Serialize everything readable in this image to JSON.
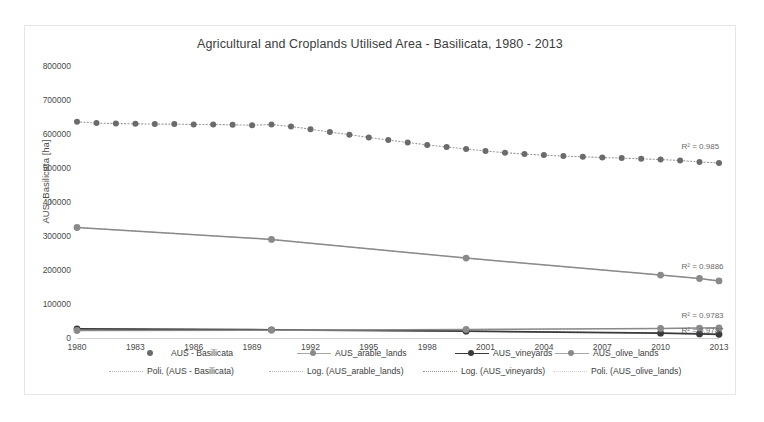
{
  "chart_data": {
    "type": "scatter",
    "title": "Agricultural and Croplands Utilised Area - Basilicata, 1980 - 2013",
    "xlabel": "",
    "ylabel": "AUS_Basilicata [ha]",
    "xlim": [
      1980,
      2013
    ],
    "ylim": [
      0,
      800000
    ],
    "grid": false,
    "legend_position": "bottom",
    "y_ticks": [
      "800000",
      "700000",
      "600000",
      "500000",
      "400000",
      "300000",
      "200000",
      "100000",
      "0"
    ],
    "y_tick_values": [
      800000,
      700000,
      600000,
      500000,
      400000,
      300000,
      200000,
      100000,
      0
    ],
    "x_ticks": [
      "1980",
      "1983",
      "1986",
      "1989",
      "1992",
      "1995",
      "1998",
      "2001",
      "2004",
      "2007",
      "2010",
      "2013"
    ],
    "x_tick_values": [
      1980,
      1983,
      1986,
      1989,
      1992,
      1995,
      1998,
      2001,
      2004,
      2007,
      2010,
      2013
    ],
    "series": [
      {
        "name": "AUS - Basilicata",
        "style": "markers-dotted",
        "color": "#6b6b6b",
        "x": [
          1980,
          1981,
          1982,
          1983,
          1984,
          1985,
          1986,
          1987,
          1988,
          1989,
          1990,
          1991,
          1992,
          1993,
          1994,
          1995,
          1996,
          1997,
          1998,
          1999,
          2000,
          2001,
          2002,
          2003,
          2004,
          2005,
          2006,
          2007,
          2008,
          2009,
          2010,
          2011,
          2012,
          2013
        ],
        "values": [
          636000,
          632000,
          631000,
          630000,
          629000,
          629000,
          628000,
          628000,
          627000,
          626000,
          628000,
          622000,
          614000,
          606000,
          598000,
          590000,
          582000,
          575000,
          568000,
          562000,
          556000,
          550000,
          545000,
          541000,
          538000,
          535000,
          533000,
          531000,
          529000,
          527000,
          525000,
          522000,
          518000,
          515000
        ]
      },
      {
        "name": "AUS_arable_lands",
        "style": "markers-line",
        "color": "#8a8a8a",
        "x": [
          1980,
          1990,
          2000,
          2010,
          2012,
          2013
        ],
        "values": [
          325000,
          290000,
          235000,
          185000,
          175000,
          168000
        ]
      },
      {
        "name": "AUS_vineyards",
        "style": "markers-line-dark",
        "color": "#3a3a3a",
        "x": [
          1980,
          1990,
          2000,
          2010,
          2012,
          2013
        ],
        "values": [
          27000,
          24000,
          20000,
          14000,
          12000,
          11000
        ]
      },
      {
        "name": "AUS_olive_lands",
        "style": "markers-line",
        "color": "#8a8a8a",
        "x": [
          1980,
          1990,
          2000,
          2010,
          2012,
          2013
        ],
        "values": [
          22000,
          23000,
          25000,
          28000,
          29000,
          30000
        ]
      }
    ],
    "trendlines": [
      {
        "name": "Poli. (AUS - Basilicata)",
        "type": "polynomial",
        "r2_label": "R² = 0.985",
        "r2": 0.985
      },
      {
        "name": "Log. (AUS_arable_lands)",
        "type": "logarithmic",
        "r2_label": "R² = 0.9886",
        "r2": 0.9886
      },
      {
        "name": "Log. (AUS_vineyards)",
        "type": "logarithmic",
        "r2_label": "R² = 0.9783",
        "r2": 0.9783
      },
      {
        "name": "Poli. (AUS_olive_lands)",
        "type": "polynomial",
        "r2_label": "R² = 0.9787",
        "r2": 0.9787
      }
    ],
    "annotations": [
      {
        "text": "R² = 0.985",
        "x": 2012,
        "y": 560000
      },
      {
        "text": "R² = 0.9886",
        "x": 2012,
        "y": 205000
      },
      {
        "text": "R² = 0.9783",
        "x": 2012,
        "y": 62000
      },
      {
        "text": "R² = 0.9787",
        "x": 2012,
        "y": 18000
      }
    ]
  },
  "legend": {
    "row1": [
      {
        "label": "AUS - Basilicata",
        "marker": "dot"
      },
      {
        "label": "AUS_arable_lands",
        "marker": "line-dot"
      },
      {
        "label": "AUS_vineyards",
        "marker": "line-dot-dark"
      },
      {
        "label": "AUS_olive_lands",
        "marker": "line-dot-mid"
      }
    ],
    "row2": [
      {
        "label": "Poli. (AUS - Basilicata)",
        "marker": "dotted"
      },
      {
        "label": "Log. (AUS_arable_lands)",
        "marker": "dotted"
      },
      {
        "label": "Log. (AUS_vineyards)",
        "marker": "dotted-dark"
      },
      {
        "label": "Poli. (AUS_olive_lands)",
        "marker": "dotted-light"
      }
    ]
  },
  "colors": {
    "series_primary": "#6b6b6b",
    "series_dark": "#3a3a3a",
    "series_mid": "#8a8a8a",
    "axis": "#d0d0d0",
    "text": "#3c3c3c",
    "frame": "#e6e6e6"
  }
}
